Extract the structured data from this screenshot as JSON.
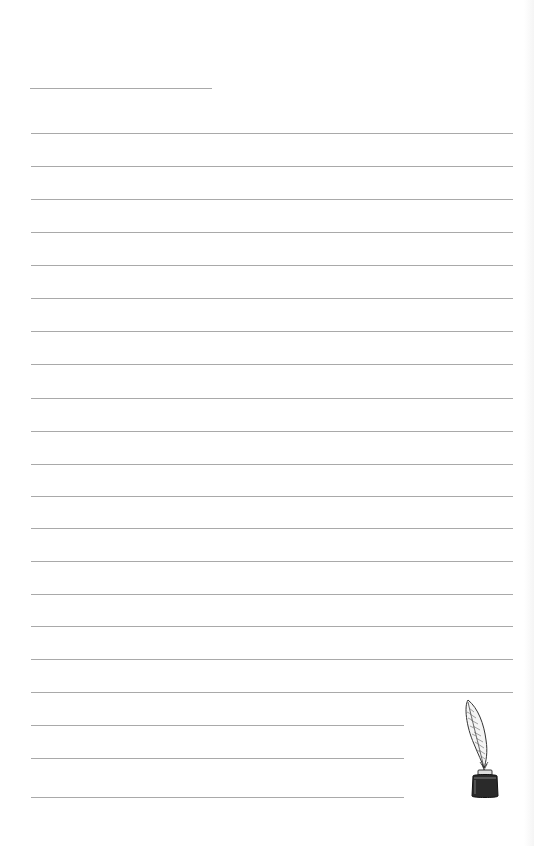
{
  "page": {
    "type": "lined-stationery",
    "background": "#ffffff",
    "rule_color": "#9a9a9a"
  },
  "title_line": {
    "x1": 30,
    "x2": 212,
    "y": 88
  },
  "rules": {
    "x_start": 31,
    "full_x_end": 513,
    "short_x_end": 404,
    "full_lines_y": [
      133,
      166,
      199,
      232,
      265,
      298,
      331,
      364,
      398,
      431,
      464,
      496,
      528,
      561,
      594,
      626,
      659,
      692
    ],
    "short_lines_y": [
      725,
      758,
      797
    ]
  },
  "decoration": {
    "icon": "quill-in-inkwell-icon",
    "ink_color": "#1a1a1a"
  }
}
